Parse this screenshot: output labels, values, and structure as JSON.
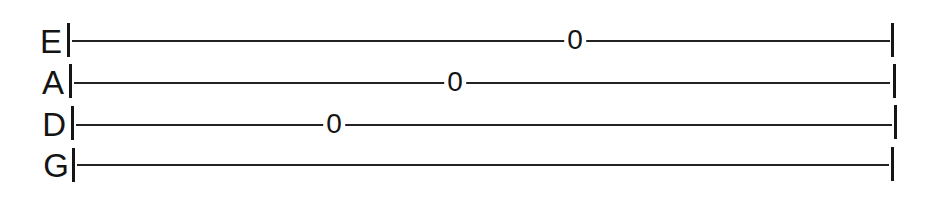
{
  "tablature": {
    "strings": [
      {
        "name": "E",
        "frets": [
          {
            "value": "0",
            "x": 575
          }
        ]
      },
      {
        "name": "A",
        "frets": [
          {
            "value": "0",
            "x": 455
          }
        ]
      },
      {
        "name": "D",
        "frets": [
          {
            "value": "0",
            "x": 334
          }
        ]
      },
      {
        "name": "G",
        "frets": []
      }
    ]
  }
}
